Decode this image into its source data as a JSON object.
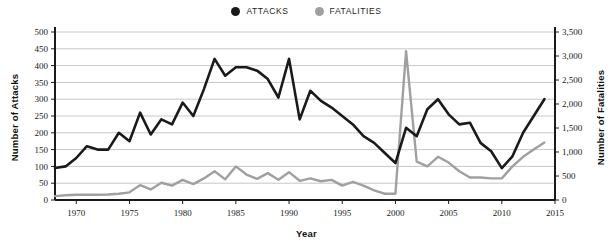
{
  "legend": {
    "items": [
      {
        "label": "ATTACKS",
        "color": "#1a1a1a",
        "marker": "filled-circle"
      },
      {
        "label": "FATALITIES",
        "color": "#a0a0a0",
        "marker": "filled-circle"
      }
    ]
  },
  "axis_titles": {
    "left": "Number of Attacks",
    "right": "Number of Fatalities",
    "bottom": "Year"
  },
  "chart_data": {
    "type": "line",
    "title": "",
    "subtitle": "",
    "xlabel": "Year",
    "ylabel": "Number of Attacks",
    "y2label": "Number of Fatalities",
    "xlim": [
      1968,
      2015
    ],
    "ylim": [
      0,
      500
    ],
    "y2lim": [
      0,
      3500
    ],
    "grid": true,
    "legend_position": "top-center",
    "xticks": [
      1970,
      1975,
      1980,
      1985,
      1990,
      1995,
      2000,
      2005,
      2010,
      2015
    ],
    "xtick_labels": [
      "1970",
      "1975",
      "1980",
      "1985",
      "1990",
      "1995",
      "2000",
      "2005",
      "2010",
      "2015"
    ],
    "yticks": [
      0,
      50,
      100,
      150,
      200,
      250,
      300,
      350,
      400,
      450,
      500
    ],
    "ytick_labels": [
      "0",
      "50",
      "100",
      "150",
      "200",
      "250",
      "300",
      "350",
      "400",
      "450",
      "500"
    ],
    "y2ticks": [
      0,
      500,
      1000,
      1500,
      2000,
      2500,
      3000,
      3500
    ],
    "y2tick_labels": [
      "0",
      "500",
      "1,000",
      "1,500",
      "2,000",
      "2,500",
      "3,000",
      "3,500"
    ],
    "x": [
      1968,
      1969,
      1970,
      1971,
      1972,
      1973,
      1974,
      1975,
      1976,
      1977,
      1978,
      1979,
      1980,
      1981,
      1982,
      1983,
      1984,
      1985,
      1986,
      1987,
      1988,
      1989,
      1990,
      1991,
      1992,
      1993,
      1994,
      1995,
      1996,
      1997,
      1998,
      1999,
      2000,
      2001,
      2002,
      2003,
      2004,
      2005,
      2006,
      2007,
      2008,
      2009,
      2010,
      2011,
      2012,
      2013,
      2014
    ],
    "series": [
      {
        "name": "ATTACKS",
        "color": "#1a1a1a",
        "axis": "left",
        "units": "attacks",
        "values": [
          95,
          100,
          125,
          160,
          150,
          150,
          200,
          175,
          260,
          195,
          240,
          225,
          290,
          250,
          330,
          420,
          370,
          395,
          395,
          385,
          360,
          305,
          420,
          240,
          325,
          295,
          275,
          250,
          225,
          190,
          170,
          140,
          110,
          215,
          190,
          270,
          300,
          255,
          225,
          230,
          170,
          145,
          95,
          130,
          200,
          250,
          300
        ]
      },
      {
        "name": "FATALITIES",
        "color": "#a0a0a0",
        "axis": "right",
        "units": "fatalities",
        "values": [
          80,
          100,
          110,
          110,
          110,
          115,
          130,
          160,
          310,
          220,
          360,
          300,
          420,
          330,
          450,
          600,
          430,
          700,
          530,
          440,
          560,
          420,
          580,
          400,
          450,
          390,
          420,
          300,
          380,
          300,
          200,
          130,
          130,
          3100,
          800,
          700,
          900,
          780,
          600,
          470,
          470,
          450,
          450,
          700,
          900,
          1050,
          1200
        ]
      }
    ],
    "annotations": [
      {
        "label": "2001 fatalities spike",
        "x": 2001,
        "y": 3100,
        "axis": "right"
      }
    ]
  }
}
